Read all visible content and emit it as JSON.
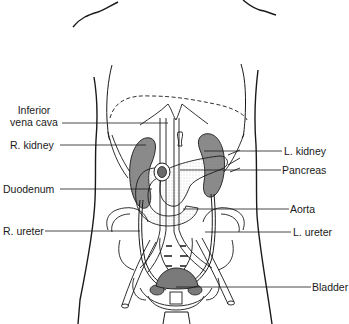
{
  "diagram": {
    "colors": {
      "line": "#1a1a1a",
      "organ_shade": "#8a8a8a",
      "bladder_shade": "#7a7a7a",
      "stipple": "#bdbdbd",
      "background": "#ffffff"
    },
    "labels_left": [
      {
        "id": "inferior-vena-cava",
        "line1": "Inferior",
        "line2": "vena cava"
      },
      {
        "id": "r-kidney",
        "text": "R. kidney"
      },
      {
        "id": "duodenum",
        "text": "Duodenum"
      },
      {
        "id": "r-ureter",
        "text": "R. ureter"
      }
    ],
    "labels_right": [
      {
        "id": "l-kidney",
        "text": "L. kidney"
      },
      {
        "id": "pancreas",
        "text": "Pancreas"
      },
      {
        "id": "aorta",
        "text": "Aorta"
      },
      {
        "id": "l-ureter",
        "text": "L. ureter"
      },
      {
        "id": "bladder",
        "text": "Bladder"
      }
    ]
  }
}
